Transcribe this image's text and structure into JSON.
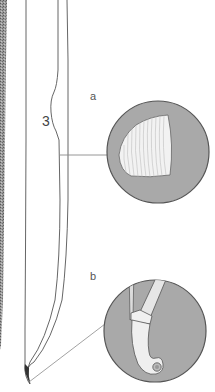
{
  "figure": {
    "type": "technical illustration",
    "labels": {
      "part_number": "3",
      "inset_a": "a",
      "inset_b": "b"
    },
    "insets": [
      {
        "id": "a",
        "depicts": "cross-section of the blade (D-shaped, striated)"
      },
      {
        "id": "b",
        "depicts": "tip of the blade with hooked end and small ring"
      }
    ],
    "colors": {
      "background": "#ffffff",
      "inset_fill": "#a9a9a9",
      "outline": "#555555",
      "leader_line": "#8a8a8a",
      "section_fill": "#f2f2f2",
      "texture_strip": "#7a7a7a"
    }
  }
}
